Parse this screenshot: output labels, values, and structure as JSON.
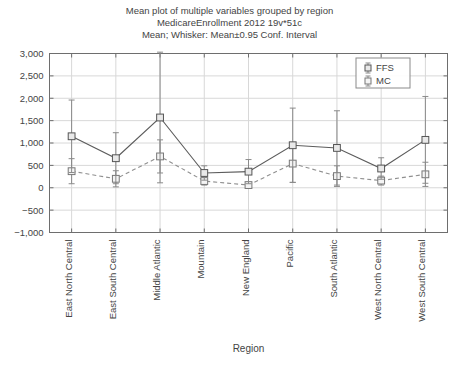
{
  "chart_data": {
    "type": "line",
    "title": "Mean plot of multiple variables grouped by region",
    "subtitle": "MedicareEnrollment 2012 19v*51c",
    "subtitle2": "Mean; Whisker: Mean±0.95 Conf. Interval",
    "xlabel": "Region",
    "ylabel": "",
    "ylim": [
      -1000,
      3000
    ],
    "grid": true,
    "legend_position": "top-right",
    "categories": [
      "East North Central",
      "East South Central",
      "Middle Atlantic",
      "Mountain",
      "New England",
      "Pacific",
      "South Atlantic",
      "West North Central",
      "West South Central"
    ],
    "ytick_labels": [
      "3,000",
      "2,500",
      "2,000",
      "1,500",
      "1,000",
      "500",
      "0",
      "−500",
      "−1,000"
    ],
    "ytick_values": [
      3000,
      2500,
      2000,
      1500,
      1000,
      500,
      0,
      -500,
      -1000
    ],
    "series": [
      {
        "name": "FFS",
        "style": "solid",
        "values": [
          1150,
          660,
          1570,
          330,
          360,
          950,
          890,
          430,
          1070
        ],
        "ci_lower": [
          340,
          90,
          110,
          170,
          90,
          120,
          60,
          190,
          100
        ],
        "ci_upper": [
          1960,
          1230,
          3030,
          490,
          630,
          1780,
          1720,
          670,
          2040
        ]
      },
      {
        "name": "MC",
        "style": "dashed",
        "values": [
          370,
          200,
          700,
          150,
          60,
          540,
          260,
          160,
          300
        ],
        "ci_lower": [
          90,
          20,
          330,
          60,
          10,
          120,
          30,
          60,
          30
        ],
        "ci_upper": [
          650,
          380,
          1070,
          240,
          110,
          960,
          490,
          260,
          570
        ]
      }
    ]
  },
  "legend": {
    "entries": [
      {
        "label": "FFS"
      },
      {
        "label": "MC"
      }
    ]
  },
  "colors": {
    "ffs": "#5c5c5c",
    "mc": "#8f8f8f",
    "grid": "#d8d8d8",
    "frame": "#6e6e6e",
    "text": "#444444"
  }
}
